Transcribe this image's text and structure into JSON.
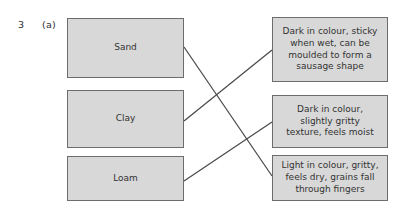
{
  "question": {
    "number": "3",
    "part": "(a)"
  },
  "left_column": {
    "items": [
      {
        "label": "Sand",
        "x": 67,
        "y": 18,
        "w": 117,
        "h": 60
      },
      {
        "label": "Clay",
        "x": 67,
        "y": 90,
        "w": 117,
        "h": 58
      },
      {
        "label": "Loam",
        "x": 67,
        "y": 156,
        "w": 117,
        "h": 45
      }
    ]
  },
  "right_column": {
    "items": [
      {
        "label": "Dark in colour, sticky\nwhen wet, can be\nmoulded to form a\nsausage shape",
        "x": 272,
        "y": 17,
        "w": 116,
        "h": 65
      },
      {
        "label": "Dark in colour,\nslightly gritty\ntexture, feels moist",
        "x": 272,
        "y": 95,
        "w": 116,
        "h": 53
      },
      {
        "label": "Light in colour, gritty,\nfeels dry, grains fall\nthrough fingers",
        "x": 272,
        "y": 155,
        "w": 116,
        "h": 46
      }
    ]
  },
  "connections": [
    {
      "from": "Sand",
      "to": "Light in colour, gritty, feels dry, grains fall through fingers",
      "x1": 184,
      "y1": 47,
      "x2": 272,
      "y2": 176
    },
    {
      "from": "Clay",
      "to": "Dark in colour, sticky when wet, can be moulded to form a sausage shape",
      "x1": 184,
      "y1": 121,
      "x2": 272,
      "y2": 50
    },
    {
      "from": "Loam",
      "to": "Dark in colour, slightly gritty texture, feels moist",
      "x1": 184,
      "y1": 181,
      "x2": 272,
      "y2": 122
    }
  ],
  "colors": {
    "box_fill": "#d8d8d8",
    "box_border": "#6d6d6d",
    "line": "#4a4a4a",
    "text": "#333333",
    "page_background": "#ffffff"
  }
}
